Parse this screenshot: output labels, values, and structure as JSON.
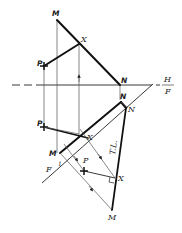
{
  "diagram": {
    "type": "descriptive-geometry",
    "colors": {
      "line": "#111111",
      "projector": "#555555",
      "background": "#ffffff"
    },
    "fold_lines": {
      "hf": {
        "top_label": "H",
        "bottom_label": "F"
      },
      "f1": {
        "label": "F",
        "sub_label": "1"
      }
    },
    "top_view": {
      "labels": {
        "M": "M",
        "X": "X",
        "N": "N",
        "P": "P"
      }
    },
    "front_view": {
      "labels": {
        "N": "N",
        "P": "P",
        "X": "X",
        "M": "M"
      }
    },
    "aux_view": {
      "labels": {
        "N": "N",
        "X": "X",
        "P": "P",
        "M": "M",
        "true_length": "T.L."
      }
    }
  }
}
